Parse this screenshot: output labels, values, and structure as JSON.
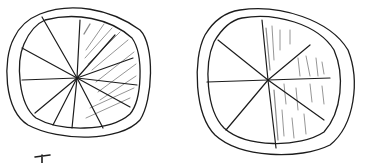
{
  "figure": {
    "ink_color": "#1c1c1c",
    "shade_color": "#8a8a8a",
    "circles": [
      {
        "name": "left-circle",
        "center": [
          77,
          78
        ],
        "outer": {
          "rx": 72,
          "ry": 65
        },
        "inner": {
          "rx": 60,
          "ry": 54
        },
        "slices_total": 12,
        "slices_shaded": 4,
        "fraction_shaded": "4/12",
        "shading_style": "diagonal-hatch",
        "spokes": [
          [
            80,
            20
          ],
          [
            42,
            17
          ],
          [
            22,
            48
          ],
          [
            22,
            80
          ],
          [
            35,
            113
          ],
          [
            53,
            125
          ],
          [
            72,
            128
          ],
          [
            103,
            128
          ],
          [
            130,
            107
          ],
          [
            137,
            85
          ],
          [
            133,
            58
          ],
          [
            115,
            35
          ]
        ]
      },
      {
        "name": "right-circle",
        "center": [
          268,
          80
        ],
        "outer": {
          "rx": 78,
          "ry": 73
        },
        "inner": {
          "rx": 64,
          "ry": 62
        },
        "slices_total": 8,
        "slices_shaded": 4,
        "fraction_shaded": "4/8",
        "shading_style": "vertical-strokes",
        "spokes": [
          [
            262,
            20
          ],
          [
            276,
            148
          ],
          [
            207,
            82
          ],
          [
            330,
            78
          ],
          [
            218,
            40
          ],
          [
            324,
            120
          ],
          [
            310,
            45
          ],
          [
            226,
            130
          ]
        ]
      }
    ],
    "stray_mark": {
      "name": "partial-stroke",
      "points": [
        [
          35,
          157
        ],
        [
          50,
          155
        ],
        [
          42,
          155
        ],
        [
          42,
          163
        ]
      ]
    }
  }
}
